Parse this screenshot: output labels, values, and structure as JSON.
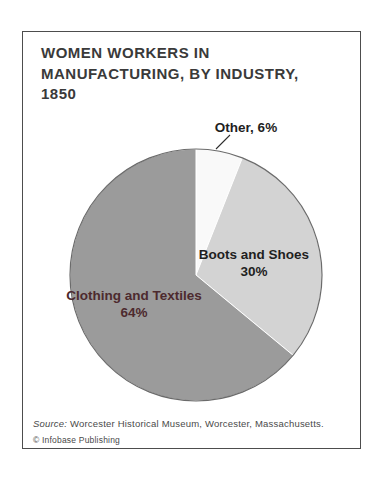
{
  "figure": {
    "title_lines": [
      "WOMEN WORKERS IN",
      "MANUFACTURING, BY INDUSTRY,",
      "1850"
    ]
  },
  "chart_data": {
    "type": "pie",
    "title": "WOMEN WORKERS IN MANUFACTURING, BY INDUSTRY, 1850",
    "start_angle_deg": 0,
    "direction": "clockwise",
    "legend_position": "labels-on-chart",
    "slices": [
      {
        "label": "Other",
        "value": 6,
        "callout_label": "Other, 6%",
        "color": "#f9f9f9",
        "label_color": "#1f1f1f"
      },
      {
        "label": "Boots and Shoes",
        "value": 30,
        "pct_label": "30%",
        "color": "#d3d3d3",
        "label_color": "#1f1f1f"
      },
      {
        "label": "Clothing and Textiles",
        "value": 64,
        "pct_label": "64%",
        "color": "#9b9b9b",
        "label_color": "#4d2a2e"
      }
    ],
    "outline_color": "#6b6b6b",
    "slice_divider_color": "#ffffff",
    "callout_line_color": "#2e2e2e"
  },
  "footer": {
    "source_prefix": "Source:",
    "source_text": "Worcester Historical Museum, Worcester, Massachusetts.",
    "copyright": "© Infobase Publishing"
  }
}
